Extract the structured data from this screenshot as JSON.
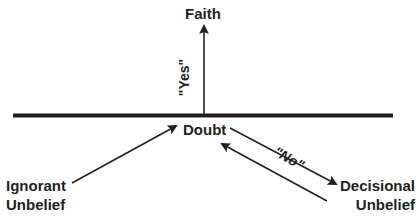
{
  "diagram": {
    "labels": {
      "faith": "Faith",
      "yes": "\"Yes\"",
      "doubt": "Doubt",
      "no": "\"No\"",
      "ignorant_line1": "Ignorant",
      "ignorant_line2": "Unbelief",
      "decisional_line1": "Decisional",
      "decisional_line2": "Unbelief"
    },
    "colors": {
      "ink": "#231f20",
      "background": "#ffffff"
    }
  }
}
